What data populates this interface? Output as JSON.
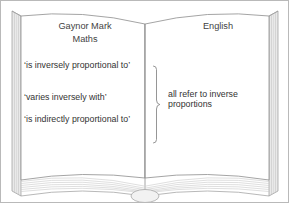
{
  "diagram": {
    "type": "open-book",
    "title_semantic": "inverse-proportion-synonyms-book"
  },
  "left_page": {
    "header_name": "Gaynor Mark",
    "header_subject": "Maths",
    "phrases": [
      "‘is inversely proportional to’",
      "‘varies inversely with’",
      "‘is indirectly proportional to’"
    ]
  },
  "right_page": {
    "header_subject": "English",
    "note": "all refer to inverse proportions"
  },
  "brace": {
    "orientation": "right-pointing",
    "groups_count": 3
  },
  "colors": {
    "page_fill": "#ffffff",
    "outline": "#8d8d8d",
    "frame": "#b9b9b9",
    "text": "#333333",
    "page_edge_light": "#e8e8e8",
    "page_edge_mid": "#cfcfcf",
    "spine_base": "#efefef"
  }
}
